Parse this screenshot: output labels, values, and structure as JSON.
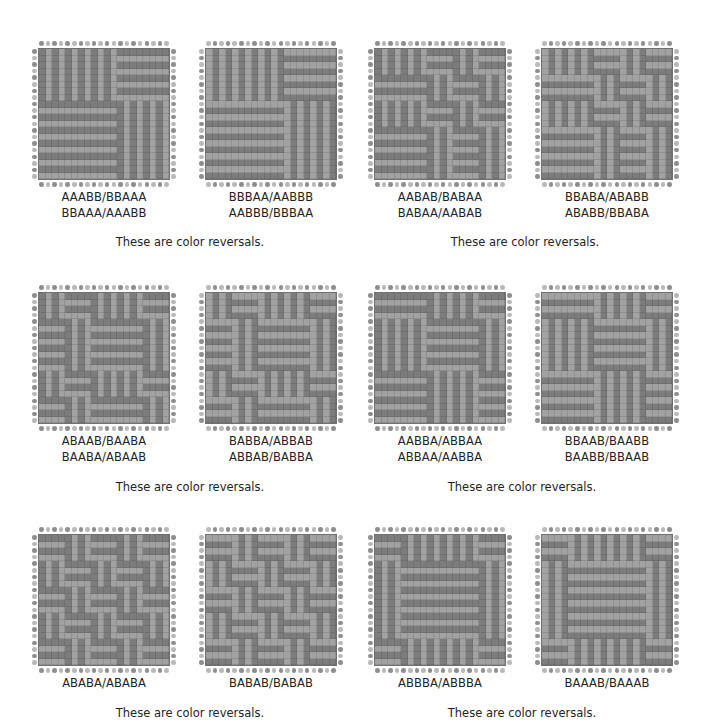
{
  "colors": {
    "dark": "#7c7c7c",
    "light": "#a2a2a2",
    "dot_dark": "#8e8e8e",
    "dot_light": "#b9b9b9"
  },
  "grid_size": 20,
  "rows": [
    {
      "drafts": [
        {
          "labels": [
            "AAABB/BBAAA",
            "BBAAA/AAABB"
          ],
          "threading": "AAABB",
          "treadling": "BBAAA",
          "reverse": false
        },
        {
          "labels": [
            "BBBAA/AABBB",
            "AABBB/BBBAA"
          ],
          "threading": "BBBAA",
          "treadling": "AABBB",
          "reverse": true
        },
        {
          "labels": [
            "AABAB/BABAA",
            "BABAA/AABAB"
          ],
          "threading": "AABAB",
          "treadling": "BABAA",
          "reverse": false
        },
        {
          "labels": [
            "BBABA/ABABB",
            "ABABB/BBABA"
          ],
          "threading": "BBABA",
          "treadling": "ABABB",
          "reverse": true
        }
      ],
      "captions": [
        "These are color reversals.",
        "These are color reversals."
      ]
    },
    {
      "drafts": [
        {
          "labels": [
            "ABAAB/BAABA",
            "BAABA/ABAAB"
          ],
          "threading": "ABAAB",
          "treadling": "BAABA",
          "reverse": false
        },
        {
          "labels": [
            "BABBA/ABBAB",
            "ABBAB/BABBA"
          ],
          "threading": "BABBA",
          "treadling": "ABBAB",
          "reverse": true
        },
        {
          "labels": [
            "AABBA/ABBAA",
            "ABBAA/AABBA"
          ],
          "threading": "AABBA",
          "treadling": "ABBAA",
          "reverse": false
        },
        {
          "labels": [
            "BBAAB/BAABB",
            "BAABB/BBAAB"
          ],
          "threading": "BBAAB",
          "treadling": "BAABB",
          "reverse": true
        }
      ],
      "captions": [
        "These are color reversals.",
        "These are color reversals."
      ]
    },
    {
      "drafts": [
        {
          "labels": [
            "ABABA/ABABA"
          ],
          "threading": "ABABA",
          "treadling": "ABABA",
          "reverse": false
        },
        {
          "labels": [
            "BABAB/BABAB"
          ],
          "threading": "BABAB",
          "treadling": "BABAB",
          "reverse": true
        },
        {
          "labels": [
            "ABBBA/ABBBA"
          ],
          "threading": "ABBBA",
          "treadling": "ABBBA",
          "reverse": false
        },
        {
          "labels": [
            "BAAAB/BAAAB"
          ],
          "threading": "BAAAB",
          "treadling": "BAAAB",
          "reverse": true
        }
      ],
      "captions": [
        "These are color reversals.",
        "These are color reversals."
      ]
    }
  ]
}
